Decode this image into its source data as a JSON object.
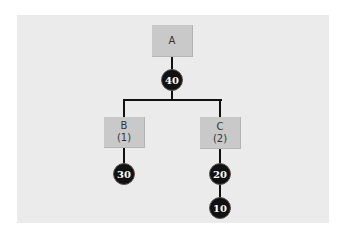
{
  "diagram": {
    "type": "tree",
    "nodes": {
      "a": {
        "label": "A"
      },
      "b": {
        "label": "B",
        "sub": "(1)"
      },
      "c": {
        "label": "C",
        "sub": "(2)"
      }
    },
    "values": {
      "a_value": "40",
      "b_value": "30",
      "c_value_1": "20",
      "c_value_2": "10"
    },
    "edges": [
      [
        "A",
        "40"
      ],
      [
        "40",
        "B"
      ],
      [
        "40",
        "C"
      ],
      [
        "B",
        "30"
      ],
      [
        "C",
        "20"
      ],
      [
        "20",
        "10"
      ]
    ],
    "colors": {
      "panel": "#ebebeb",
      "box": "#c9c9c9",
      "circle": "#111111",
      "line": "#111111"
    }
  }
}
